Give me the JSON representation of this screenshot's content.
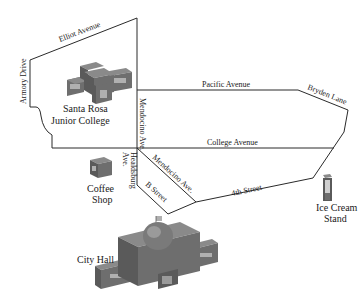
{
  "streets": {
    "elliot": "Elliot Avenue",
    "armory": "Armory Drive",
    "mendocino_vertical": "Mendocino Ave.",
    "pacific": "Pacific Avenue",
    "bryden": "Bryden Lane",
    "college": "College Avenue",
    "healdsburg_line1": "Healdsburg",
    "healdsburg_line2": "Ave.",
    "mendocino_diagonal": "Mendocino Ave.",
    "b_street": "B Street",
    "fourth": "4th Street"
  },
  "places": {
    "srjc_line1": "Santa Rosa",
    "srjc_line2": "Junior College",
    "coffee_line1": "Coffee",
    "coffee_line2": "Shop",
    "icecream_line1": "Ice Cream",
    "icecream_line2": "Stand",
    "cityhall": "City Hall"
  },
  "colors": {
    "road": "#2a2a2a",
    "building_top": "#8a8a8a",
    "building_side": "#5a5a5a",
    "building_front": "#6e6e6e",
    "window": "#b0b0b0"
  }
}
